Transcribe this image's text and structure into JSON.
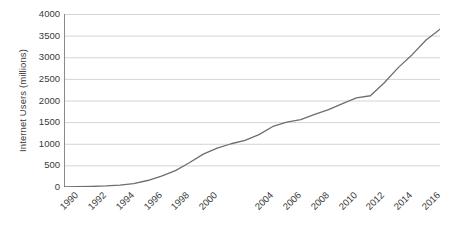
{
  "chart_data": {
    "type": "line",
    "title": "",
    "xlabel": "",
    "ylabel": "Internet Users (millions)",
    "ylim": [
      0,
      4000
    ],
    "xlim": [
      1990,
      2017
    ],
    "grid": true,
    "legend": false,
    "y_ticks": [
      0,
      500,
      1000,
      1500,
      2000,
      2500,
      3000,
      3500,
      4000
    ],
    "y_tick_labels": [
      "0",
      "500",
      "1000",
      "1500",
      "2000",
      "2500",
      "3000",
      "3500",
      "4000"
    ],
    "x_tick_labels": [
      "1990",
      "1992",
      "1994",
      "1996",
      "1998",
      "2000",
      "2004",
      "2006",
      "2008",
      "2010",
      "2012",
      "2014",
      "2016"
    ],
    "x_tick_label_years": [
      1990,
      1992,
      1994,
      1996,
      1998,
      2000,
      2004,
      2006,
      2008,
      2010,
      2012,
      2014,
      2016
    ],
    "x_minor_tick_years": [
      1990,
      1991,
      1992,
      1993,
      1994,
      1995,
      1996,
      1997,
      1998,
      1999,
      2000,
      2001,
      2002,
      2003,
      2004,
      2005,
      2006,
      2007,
      2008,
      2009,
      2010,
      2011,
      2012,
      2013,
      2014,
      2015,
      2016,
      2017
    ],
    "series": [
      {
        "name": "Internet Users",
        "color": "#6e6e6e",
        "x": [
          1990,
          1991,
          1992,
          1993,
          1994,
          1995,
          1996,
          1997,
          1998,
          1999,
          2000,
          2001,
          2002,
          2003,
          2004,
          2005,
          2006,
          2007,
          2008,
          2009,
          2010,
          2011,
          2012,
          2013,
          2014,
          2015,
          2016,
          2017
        ],
        "values": [
          3,
          6,
          12,
          25,
          45,
          80,
          150,
          250,
          380,
          560,
          760,
          900,
          1000,
          1080,
          1210,
          1400,
          1500,
          1560,
          1680,
          1790,
          1930,
          2060,
          2110,
          2410,
          2760,
          3060,
          3400,
          3650
        ]
      }
    ],
    "colors": {
      "line": "#6e6e6e",
      "gridline": "#d4d4d4",
      "axis": "#8a8a8a",
      "text": "#3a3a3a",
      "background": "#ffffff"
    }
  }
}
